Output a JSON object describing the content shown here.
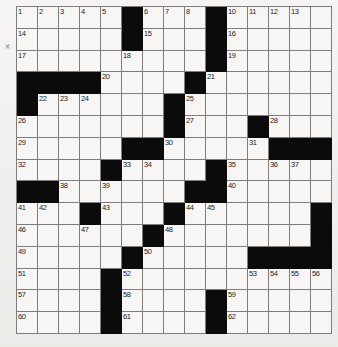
{
  "puzzle": {
    "type": "crossword-grid",
    "rows": 15,
    "columns": 15,
    "colors": {
      "block": "#0b0b0b",
      "cell": "#f7f6f4",
      "rule": "#7d7d7d",
      "paper": "#f0efed",
      "number_text": "#1d1d1d"
    },
    "margin_mark": "×",
    "blocks": [
      [
        1,
        6
      ],
      [
        1,
        10
      ],
      [
        2,
        6
      ],
      [
        2,
        10
      ],
      [
        3,
        10
      ],
      [
        4,
        1
      ],
      [
        4,
        2
      ],
      [
        4,
        3
      ],
      [
        4,
        4
      ],
      [
        4,
        9
      ],
      [
        5,
        1
      ],
      [
        5,
        8
      ],
      [
        6,
        8
      ],
      [
        6,
        12
      ],
      [
        7,
        6
      ],
      [
        7,
        7
      ],
      [
        7,
        13
      ],
      [
        7,
        14
      ],
      [
        7,
        15
      ],
      [
        8,
        5
      ],
      [
        8,
        10
      ],
      [
        9,
        1
      ],
      [
        9,
        2
      ],
      [
        9,
        9
      ],
      [
        9,
        10
      ],
      [
        10,
        4
      ],
      [
        10,
        8
      ],
      [
        10,
        15
      ],
      [
        11,
        7
      ],
      [
        11,
        15
      ],
      [
        12,
        6
      ],
      [
        12,
        12
      ],
      [
        12,
        13
      ],
      [
        12,
        14
      ],
      [
        12,
        15
      ],
      [
        13,
        5
      ],
      [
        14,
        5
      ],
      [
        14,
        10
      ],
      [
        15,
        5
      ],
      [
        15,
        10
      ]
    ],
    "numbers": [
      {
        "n": 1,
        "row": 1,
        "col": 1
      },
      {
        "n": 2,
        "row": 1,
        "col": 2
      },
      {
        "n": 3,
        "row": 1,
        "col": 3
      },
      {
        "n": 4,
        "row": 1,
        "col": 4
      },
      {
        "n": 5,
        "row": 1,
        "col": 5
      },
      {
        "n": 6,
        "row": 1,
        "col": 7
      },
      {
        "n": 7,
        "row": 1,
        "col": 8
      },
      {
        "n": 8,
        "row": 1,
        "col": 9
      },
      {
        "n": 9,
        "row": 1,
        "col": 10
      },
      {
        "n": 10,
        "row": 1,
        "col": 11
      },
      {
        "n": 11,
        "row": 1,
        "col": 12
      },
      {
        "n": 12,
        "row": 1,
        "col": 13
      },
      {
        "n": 13,
        "row": 1,
        "col": 14
      },
      {
        "n": 14,
        "row": 2,
        "col": 1
      },
      {
        "n": 15,
        "row": 2,
        "col": 7
      },
      {
        "n": 16,
        "row": 2,
        "col": 11
      },
      {
        "n": 17,
        "row": 3,
        "col": 1
      },
      {
        "n": 18,
        "row": 3,
        "col": 6
      },
      {
        "n": 19,
        "row": 3,
        "col": 11
      },
      {
        "n": 20,
        "row": 4,
        "col": 5
      },
      {
        "n": 21,
        "row": 4,
        "col": 10
      },
      {
        "n": 22,
        "row": 5,
        "col": 2
      },
      {
        "n": 23,
        "row": 5,
        "col": 3
      },
      {
        "n": 24,
        "row": 5,
        "col": 4
      },
      {
        "n": 25,
        "row": 5,
        "col": 9
      },
      {
        "n": 26,
        "row": 6,
        "col": 1
      },
      {
        "n": 27,
        "row": 6,
        "col": 9
      },
      {
        "n": 28,
        "row": 6,
        "col": 13
      },
      {
        "n": 29,
        "row": 7,
        "col": 1
      },
      {
        "n": 30,
        "row": 7,
        "col": 8
      },
      {
        "n": 31,
        "row": 7,
        "col": 12
      },
      {
        "n": 32,
        "row": 8,
        "col": 1
      },
      {
        "n": 33,
        "row": 8,
        "col": 6
      },
      {
        "n": 34,
        "row": 8,
        "col": 7
      },
      {
        "n": 35,
        "row": 8,
        "col": 11
      },
      {
        "n": 36,
        "row": 8,
        "col": 13
      },
      {
        "n": 37,
        "row": 8,
        "col": 14
      },
      {
        "n": 38,
        "row": 9,
        "col": 3
      },
      {
        "n": 39,
        "row": 9,
        "col": 5
      },
      {
        "n": 40,
        "row": 9,
        "col": 11
      },
      {
        "n": 41,
        "row": 10,
        "col": 1
      },
      {
        "n": 42,
        "row": 10,
        "col": 2
      },
      {
        "n": 43,
        "row": 10,
        "col": 5
      },
      {
        "n": 44,
        "row": 10,
        "col": 9
      },
      {
        "n": 45,
        "row": 10,
        "col": 10
      },
      {
        "n": 46,
        "row": 11,
        "col": 1
      },
      {
        "n": 47,
        "row": 11,
        "col": 4
      },
      {
        "n": 48,
        "row": 11,
        "col": 8
      },
      {
        "n": 49,
        "row": 12,
        "col": 1
      },
      {
        "n": 50,
        "row": 12,
        "col": 7
      },
      {
        "n": 51,
        "row": 13,
        "col": 1
      },
      {
        "n": 52,
        "row": 13,
        "col": 6
      },
      {
        "n": 53,
        "row": 13,
        "col": 12
      },
      {
        "n": 54,
        "row": 13,
        "col": 13
      },
      {
        "n": 55,
        "row": 13,
        "col": 14
      },
      {
        "n": 56,
        "row": 13,
        "col": 15
      },
      {
        "n": 57,
        "row": 14,
        "col": 1
      },
      {
        "n": 58,
        "row": 14,
        "col": 6
      },
      {
        "n": 59,
        "row": 14,
        "col": 11
      },
      {
        "n": 60,
        "row": 15,
        "col": 1
      },
      {
        "n": 61,
        "row": 15,
        "col": 6
      },
      {
        "n": 62,
        "row": 15,
        "col": 11
      }
    ]
  }
}
